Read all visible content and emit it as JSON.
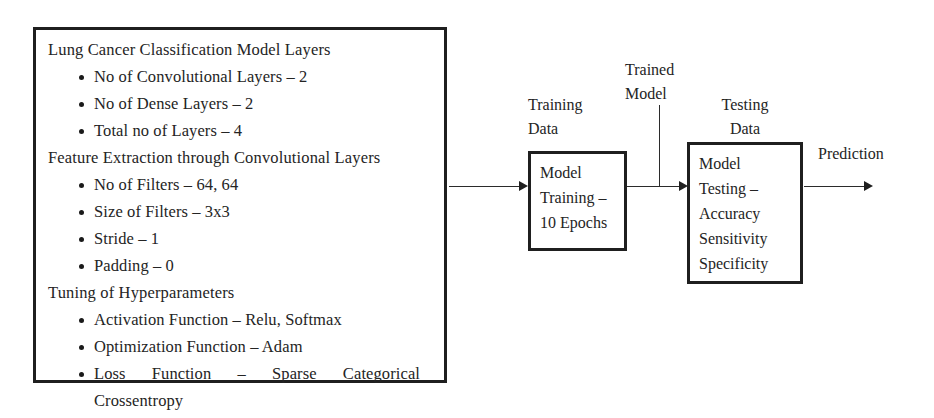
{
  "spec_panel": {
    "sections": [
      {
        "heading": "Lung Cancer Classification Model  Layers",
        "items": [
          "No of Convolutional Layers – 2",
          "No of Dense Layers – 2",
          "Total no of  Layers – 4"
        ]
      },
      {
        "heading": "Feature Extraction through Convolutional Layers",
        "items": [
          "No of Filters – 64, 64",
          "Size of Filters – 3x3",
          "Stride – 1",
          "Padding – 0"
        ]
      },
      {
        "heading": "Tuning of Hyperparameters",
        "items": [
          "Activation Function – Relu, Softmax",
          "Optimization Function – Adam"
        ],
        "justified_item": {
          "line1": "Loss Function – Sparse Categorical",
          "line2": "Crossentropy"
        }
      }
    ]
  },
  "flow": {
    "training_box": {
      "label_above": "Training\nData",
      "line1": "Model",
      "line2": "Training –",
      "line3": "10 Epochs"
    },
    "trained_model_label": "Trained\nModel",
    "testing_box": {
      "label_above": "Testing\nData",
      "line1": "Model",
      "line2": "Testing –",
      "line3": "Accuracy",
      "line4": "Sensitivity",
      "line5": "Specificity"
    },
    "prediction_label": "Prediction"
  },
  "colors": {
    "background": "#ffffff",
    "ink": "#242424",
    "border": "#1f1f1f",
    "connector": "#2b2b2b"
  }
}
